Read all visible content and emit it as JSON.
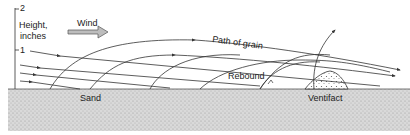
{
  "diagram": {
    "axis": {
      "label_line1": "Height,",
      "label_line2": "inches",
      "tick_2": "2",
      "tick_1": "1"
    },
    "labels": {
      "wind": "Wind",
      "path_of_grain": "Path of grain",
      "rebound": "Rebound",
      "sand": "Sand",
      "ventifact": "Ventifact"
    },
    "colors": {
      "line": "#333333",
      "ground": "#d6d6d6",
      "arrow_fill": "#bdbdbd"
    }
  }
}
